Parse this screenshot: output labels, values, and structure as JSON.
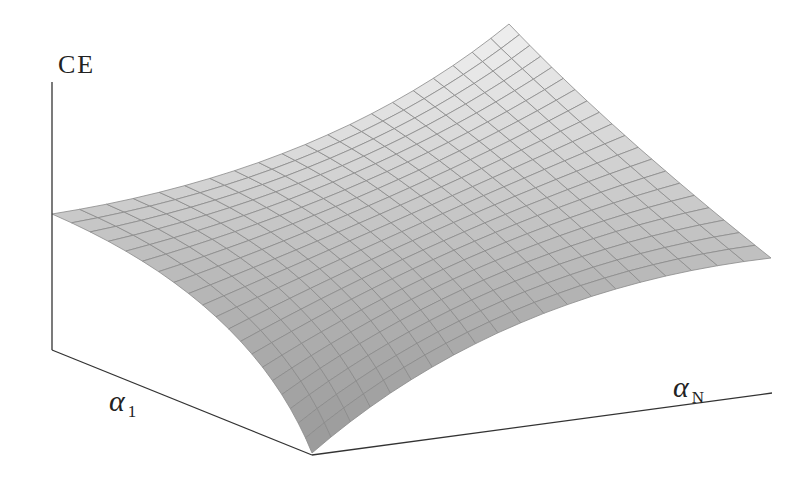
{
  "figure": {
    "z_axis_label": "CE",
    "x_axis_label": {
      "symbol": "α",
      "subscript": "1"
    },
    "y_axis_label": {
      "symbol": "α",
      "subscript": "N"
    }
  },
  "chart_data": {
    "type": "surface",
    "title": "",
    "zlabel": "CE",
    "xlabel": "α1",
    "ylabel": "αN",
    "grid": {
      "rows": 20,
      "cols": 20
    },
    "corners_screen": {
      "alpha1_min_alphaN_min": [
        52,
        214
      ],
      "alpha1_max_alphaN_min": [
        312,
        453
      ],
      "alpha1_min_alphaN_max": [
        509,
        24
      ],
      "alpha1_max_alphaN_max": [
        771,
        258
      ]
    },
    "edge_controls_screen": {
      "alphaN_min_edge": [
        250,
        300
      ],
      "alphaN_max_edge": [
        610,
        130
      ],
      "alpha1_min_edge": [
        330,
        170
      ],
      "alpha1_max_edge": [
        500,
        290
      ]
    },
    "relative_height": {
      "alpha1_min_alphaN_min": 0.55,
      "alpha1_max_alphaN_min": 0.0,
      "alpha1_min_alphaN_max": 1.0,
      "alpha1_max_alphaN_max": 0.45
    },
    "shading": {
      "low": "#9a9a9a",
      "high": "#efefef",
      "gridline": "#8a8a8a"
    },
    "axes": {
      "z_axis": [
        [
          52,
          82
        ],
        [
          52,
          350
        ]
      ],
      "alpha1_axis": [
        [
          52,
          350
        ],
        [
          312,
          455
        ]
      ],
      "alphaN_axis": [
        [
          312,
          455
        ],
        [
          772,
          393
        ]
      ]
    }
  }
}
